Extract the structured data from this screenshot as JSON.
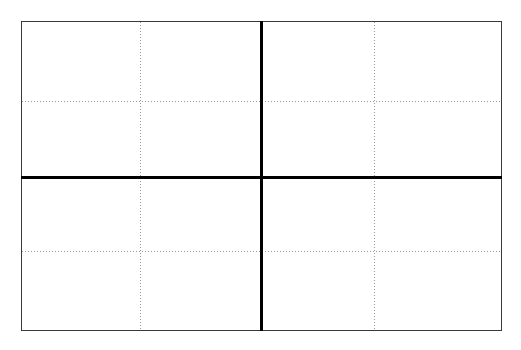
{
  "figure": {
    "title": "",
    "background_color": "#ffffff",
    "width": 521,
    "height": 350
  },
  "plot_area": {
    "left": 21,
    "top": 21,
    "right": 502,
    "bottom": 331,
    "border_color": "#3a3a3a",
    "border_width": 1,
    "fill_color": "#ffffff"
  },
  "chart_data": {
    "type": "line",
    "title": "",
    "subtitle": "",
    "xlabel": "",
    "ylabel": "",
    "xlim": [
      -2,
      2
    ],
    "ylim": [
      -2,
      2
    ],
    "xticks": [],
    "yticks": [],
    "xticklabels": [],
    "yticklabels": [],
    "series": [
      {
        "name": "vertical-axis",
        "orientation": "vertical",
        "value": 0,
        "color": "#000000",
        "linewidth": 3,
        "linestyle": "solid"
      },
      {
        "name": "horizontal-axis",
        "orientation": "horizontal",
        "value": 0,
        "color": "#000000",
        "linewidth": 3,
        "linestyle": "solid"
      }
    ],
    "grid": {
      "visible": true,
      "color": "#9a9a9a",
      "linestyle": "dotted",
      "linewidth": 1,
      "vertical_positions": [
        -1,
        1
      ],
      "horizontal_positions": [
        1,
        -1
      ]
    },
    "legend": {
      "visible": false,
      "position": "none",
      "entries": []
    },
    "annotations": []
  },
  "gridlines": {
    "vertical": [
      {
        "name": "gridline-v-left",
        "x": 140
      },
      {
        "name": "gridline-v-right",
        "x": 374
      }
    ],
    "horizontal": [
      {
        "name": "gridline-h-upper",
        "y": 101
      },
      {
        "name": "gridline-h-lower",
        "y": 251
      }
    ]
  },
  "axes": {
    "vertical": {
      "name": "axis-vertical",
      "x": 260,
      "thickness": 3,
      "color": "#000000"
    },
    "horizontal": {
      "name": "axis-horizontal",
      "y": 176,
      "thickness": 3,
      "color": "#000000"
    }
  }
}
